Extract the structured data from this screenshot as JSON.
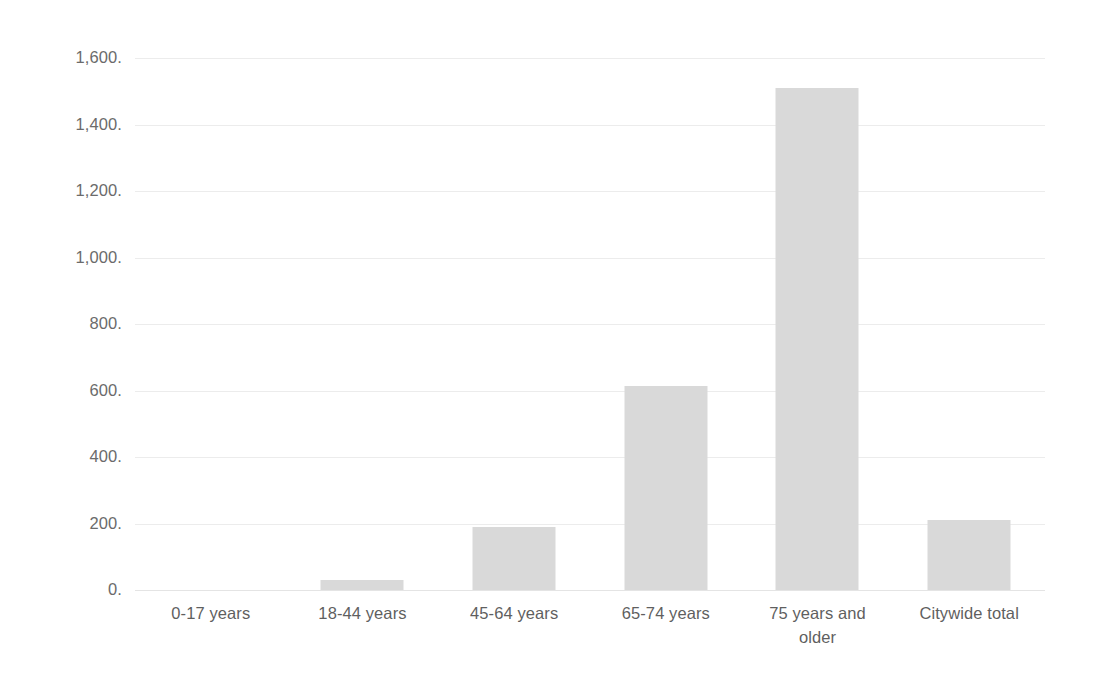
{
  "chart_data": {
    "type": "bar",
    "title": "",
    "subtitle": "",
    "xlabel": "",
    "ylabel": "",
    "categories": [
      "0-17 years",
      "18-44 years",
      "45-64 years",
      "65-74 years",
      "75 years and older",
      "Citywide total"
    ],
    "values": [
      0,
      30,
      190,
      615,
      1510,
      210
    ],
    "ylim": [
      0,
      1600
    ],
    "ytick_values": [
      0,
      200,
      400,
      600,
      800,
      1000,
      1200,
      1400,
      1600
    ],
    "ytick_labels": [
      "0.",
      "200.",
      "400.",
      "600.",
      "800.",
      "1,000.",
      "1,200.",
      "1,400.",
      "1,600."
    ],
    "grid": true,
    "grid_axis": "y",
    "legend": false,
    "legend_position": "none",
    "bar_color": "#d9d9d9",
    "gridline_color": "#ececec",
    "axis_text_color": "#6b6b6b",
    "background_color": "#ffffff",
    "annotations": []
  },
  "axis": {
    "ytick_0": "0.",
    "ytick_200": "200.",
    "ytick_400": "400.",
    "ytick_600": "600.",
    "ytick_800": "800.",
    "ytick_1000": "1,000.",
    "ytick_1200": "1,200.",
    "ytick_1400": "1,400.",
    "ytick_1600": "1,600."
  },
  "categories": {
    "c0": "0-17 years",
    "c1": "18-44 years",
    "c2": "45-64 years",
    "c3_line1": "65-74 years",
    "c4_line1": "75 years and",
    "c4_line2": "older",
    "c5": "Citywide total"
  }
}
